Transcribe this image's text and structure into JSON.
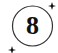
{
  "badge": {
    "number": "8",
    "stroke_color": "#333333",
    "text_color": "#111111",
    "icons": [
      "sparkle-icon",
      "sparkle-icon"
    ]
  }
}
